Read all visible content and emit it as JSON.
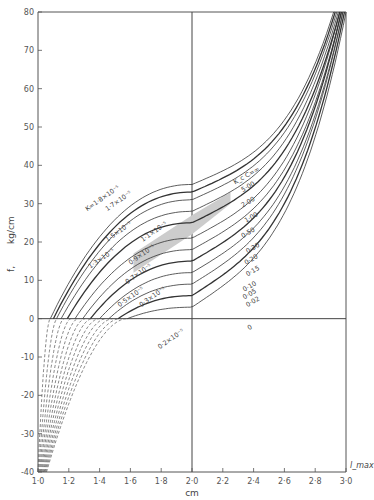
{
  "chart_data": {
    "type": "line",
    "title": "",
    "xlabel": "cm",
    "xlabel_right": "l_max",
    "ylabel": "f, kg/cm",
    "ylabel_symbol": "f,",
    "ylabel_units": "kg/cm",
    "xlim": [
      1.0,
      3.0
    ],
    "ylim": [
      -40,
      80
    ],
    "x_ticks": [
      1.0,
      1.2,
      1.4,
      1.6,
      1.8,
      2.0,
      2.2,
      2.4,
      2.6,
      2.8,
      3.0
    ],
    "x_tick_labels": [
      "1·0",
      "1·2",
      "1·4",
      "1·6",
      "1·8",
      "2·0",
      "2·2",
      "2·4",
      "2·6",
      "2·8",
      "3·0"
    ],
    "y_ticks": [
      -40,
      -30,
      -20,
      -10,
      0,
      10,
      20,
      30,
      40,
      50,
      60,
      70,
      80
    ],
    "y_tick_labels": [
      "-40",
      "-30",
      "-20",
      "-10",
      "0",
      "10",
      "20",
      "30",
      "40",
      "50",
      "60",
      "70",
      "80"
    ],
    "grid": false,
    "reference_lines": {
      "x": 2.0,
      "y": 0
    },
    "series_group_right": {
      "description": "Kc values labelled on right side",
      "labels": [
        "K_c C=∞",
        "5·00",
        "2·00",
        "1·00",
        "0·50",
        "0·30",
        "0·20",
        "0·15",
        "0·10",
        "0·05",
        "0·02",
        "0"
      ]
    },
    "series_group_left": {
      "description": "K labels on left side",
      "labels": [
        "K=1·8×10⁻⁵",
        "1·7×10⁻⁵",
        "1·5×10⁻⁵",
        "1·3×10⁻⁵",
        "1·1×10⁻⁵",
        "0·9×10⁻⁵",
        "0·7×10⁻⁵",
        "0·5×10⁻⁵",
        "0·3×10⁻⁵",
        "0·2×10⁻⁵"
      ]
    },
    "series": [
      {
        "name": "K_c C=∞",
        "style": "solid",
        "x0": 1.08,
        "y_at_2": 35,
        "x_end": 2.92
      },
      {
        "name": "5·00",
        "style": "solid",
        "x0": 1.1,
        "y_at_2": 33,
        "x_end": 2.93
      },
      {
        "name": "2·00",
        "style": "solid",
        "x0": 1.12,
        "y_at_2": 31,
        "x_end": 2.94
      },
      {
        "name": "1·00",
        "style": "solid",
        "x0": 1.15,
        "y_at_2": 28,
        "x_end": 2.95
      },
      {
        "name": "0·50",
        "style": "solid",
        "x0": 1.19,
        "y_at_2": 25,
        "x_end": 2.96
      },
      {
        "name": "0·30",
        "style": "solid",
        "x0": 1.24,
        "y_at_2": 21,
        "x_end": 2.96
      },
      {
        "name": "0·20",
        "style": "solid",
        "x0": 1.29,
        "y_at_2": 18,
        "x_end": 2.97
      },
      {
        "name": "0·15",
        "style": "solid",
        "x0": 1.34,
        "y_at_2": 15,
        "x_end": 2.97
      },
      {
        "name": "0·10",
        "style": "solid",
        "x0": 1.4,
        "y_at_2": 12,
        "x_end": 2.98
      },
      {
        "name": "0·05",
        "style": "solid",
        "x0": 1.46,
        "y_at_2": 9,
        "x_end": 2.98
      },
      {
        "name": "0·02",
        "style": "solid",
        "x0": 1.52,
        "y_at_2": 6,
        "x_end": 2.99
      },
      {
        "name": "0",
        "style": "solid",
        "x0": 1.58,
        "y_at_2": 3,
        "x_end": 3.0
      }
    ],
    "dashed_series_count": 12,
    "annotations": [
      "shaded band between 1·5×10⁻⁵ and 1·1×10⁻⁵ curves near x=1·7–2·2"
    ]
  }
}
